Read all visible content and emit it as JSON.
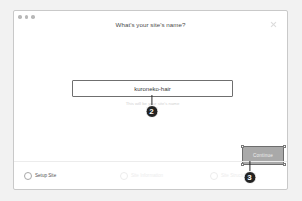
{
  "window": {
    "traffic_lights": [
      "close-dot",
      "minimize-dot",
      "maximize-dot"
    ],
    "title": "What's your site's name?",
    "close_icon": "close-icon"
  },
  "form": {
    "site_name_value": "kuroneko-hair",
    "site_name_placeholder": "Enter your site name",
    "hint": "This will be your site's name"
  },
  "actions": {
    "continue_label": "Continue"
  },
  "stepper": {
    "steps": [
      {
        "label": "Setup Site",
        "state": "active"
      },
      {
        "label": "Site Information",
        "state": "inactive"
      },
      {
        "label": "Site Structure",
        "state": "inactive"
      }
    ]
  },
  "annotations": [
    {
      "number": "2",
      "target": "site-name-input"
    },
    {
      "number": "3",
      "target": "continue-button"
    }
  ]
}
